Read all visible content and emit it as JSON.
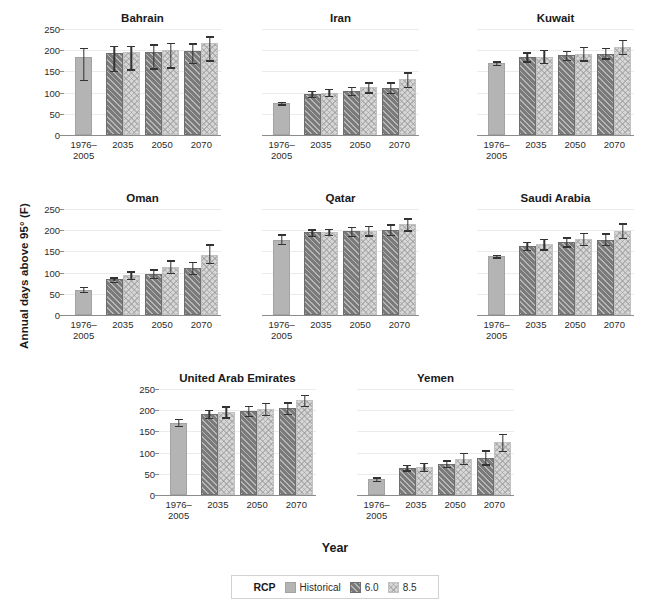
{
  "chart_data": {
    "type": "bar",
    "title": "",
    "xlabel": "Year",
    "ylabel": "Annual days above 95° (F)",
    "categories": [
      "1976–\n2005",
      "2035",
      "2050",
      "2070"
    ],
    "category_labels": [
      [
        "1976–",
        "2005"
      ],
      [
        "2035",
        ""
      ],
      [
        "2050",
        ""
      ],
      [
        "2070",
        ""
      ]
    ],
    "ylim": [
      0,
      250
    ],
    "yticks": [
      0,
      50,
      100,
      150,
      200,
      250
    ],
    "grid": true,
    "legend": {
      "title": "RCP",
      "position": "bottom-center",
      "entries": [
        {
          "label": "Historical",
          "key": "historical",
          "color": "#b4b4b4",
          "pattern": "solid"
        },
        {
          "label": "6.0",
          "key": "rcp60",
          "color": "#7a7a7a",
          "pattern": "diagonal-hatch"
        },
        {
          "label": "8.5",
          "key": "rcp85",
          "color": "#d6d6d6",
          "pattern": "crosshatch"
        }
      ]
    },
    "series": [
      {
        "name": "Historical",
        "key": "historical"
      },
      {
        "name": "6.0",
        "key": "rcp60"
      },
      {
        "name": "8.5",
        "key": "rcp85"
      }
    ],
    "panels": [
      {
        "title": "Bahrain",
        "show_yaxis": true,
        "row": 0,
        "col": 0,
        "data": [
          {
            "year": "1976–2005",
            "historical": {
              "value": 184,
              "low": 130,
              "high": 205
            },
            "rcp60": null,
            "rcp85": null
          },
          {
            "year": "2035",
            "historical": null,
            "rcp60": {
              "value": 194,
              "low": 151,
              "high": 210
            },
            "rcp85": {
              "value": 196,
              "low": 155,
              "high": 211
            }
          },
          {
            "year": "2050",
            "historical": null,
            "rcp60": {
              "value": 196,
              "low": 157,
              "high": 214
            },
            "rcp85": {
              "value": 200,
              "low": 160,
              "high": 217
            }
          },
          {
            "year": "2070",
            "historical": null,
            "rcp60": {
              "value": 199,
              "low": 170,
              "high": 216
            },
            "rcp85": {
              "value": 216,
              "low": 176,
              "high": 233
            }
          }
        ]
      },
      {
        "title": "Iran",
        "show_yaxis": false,
        "row": 0,
        "col": 1,
        "data": [
          {
            "year": "1976–2005",
            "historical": {
              "value": 75,
              "low": 72,
              "high": 78
            },
            "rcp60": null,
            "rcp85": null
          },
          {
            "year": "2035",
            "historical": null,
            "rcp60": {
              "value": 97,
              "low": 90,
              "high": 104
            },
            "rcp85": {
              "value": 100,
              "low": 92,
              "high": 109
            }
          },
          {
            "year": "2050",
            "historical": null,
            "rcp60": {
              "value": 104,
              "low": 95,
              "high": 114
            },
            "rcp85": {
              "value": 113,
              "low": 101,
              "high": 124
            }
          },
          {
            "year": "2070",
            "historical": null,
            "rcp60": {
              "value": 111,
              "low": 100,
              "high": 124
            },
            "rcp85": {
              "value": 131,
              "low": 113,
              "high": 148
            }
          }
        ]
      },
      {
        "title": "Kuwait",
        "show_yaxis": false,
        "row": 0,
        "col": 2,
        "data": [
          {
            "year": "1976–2005",
            "historical": {
              "value": 170,
              "low": 166,
              "high": 174
            },
            "rcp60": null,
            "rcp85": null
          },
          {
            "year": "2035",
            "historical": null,
            "rcp60": {
              "value": 184,
              "low": 174,
              "high": 195
            },
            "rcp85": {
              "value": 185,
              "low": 170,
              "high": 201
            }
          },
          {
            "year": "2050",
            "historical": null,
            "rcp60": {
              "value": 188,
              "low": 178,
              "high": 199
            },
            "rcp85": {
              "value": 191,
              "low": 176,
              "high": 208
            }
          },
          {
            "year": "2070",
            "historical": null,
            "rcp60": {
              "value": 192,
              "low": 181,
              "high": 205
            },
            "rcp85": {
              "value": 208,
              "low": 192,
              "high": 224
            }
          }
        ]
      },
      {
        "title": "Oman",
        "show_yaxis": true,
        "row": 1,
        "col": 0,
        "data": [
          {
            "year": "1976–2005",
            "historical": {
              "value": 60,
              "low": 54,
              "high": 66
            },
            "rcp60": null,
            "rcp85": null
          },
          {
            "year": "2035",
            "historical": null,
            "rcp60": {
              "value": 84,
              "low": 79,
              "high": 89
            },
            "rcp85": {
              "value": 94,
              "low": 86,
              "high": 103
            }
          },
          {
            "year": "2050",
            "historical": null,
            "rcp60": {
              "value": 97,
              "low": 88,
              "high": 108
            },
            "rcp85": {
              "value": 114,
              "low": 100,
              "high": 129
            }
          },
          {
            "year": "2070",
            "historical": null,
            "rcp60": {
              "value": 110,
              "low": 97,
              "high": 126
            },
            "rcp85": {
              "value": 142,
              "low": 123,
              "high": 167
            }
          }
        ]
      },
      {
        "title": "Qatar",
        "show_yaxis": false,
        "row": 1,
        "col": 1,
        "data": [
          {
            "year": "1976–2005",
            "historical": {
              "value": 178,
              "low": 168,
              "high": 190
            },
            "rcp60": null,
            "rcp85": null
          },
          {
            "year": "2035",
            "historical": null,
            "rcp60": {
              "value": 195,
              "low": 187,
              "high": 202
            },
            "rcp85": {
              "value": 196,
              "low": 189,
              "high": 203
            }
          },
          {
            "year": "2050",
            "historical": null,
            "rcp60": {
              "value": 197,
              "low": 187,
              "high": 208
            },
            "rcp85": {
              "value": 199,
              "low": 188,
              "high": 211
            }
          },
          {
            "year": "2070",
            "historical": null,
            "rcp60": {
              "value": 201,
              "low": 189,
              "high": 214
            },
            "rcp85": {
              "value": 214,
              "low": 200,
              "high": 228
            }
          }
        ]
      },
      {
        "title": "Saudi Arabia",
        "show_yaxis": false,
        "row": 1,
        "col": 2,
        "data": [
          {
            "year": "1976–2005",
            "historical": {
              "value": 139,
              "low": 136,
              "high": 142
            },
            "rcp60": null,
            "rcp85": null
          },
          {
            "year": "2035",
            "historical": null,
            "rcp60": {
              "value": 163,
              "low": 154,
              "high": 173
            },
            "rcp85": {
              "value": 167,
              "low": 155,
              "high": 180
            }
          },
          {
            "year": "2050",
            "historical": null,
            "rcp60": {
              "value": 172,
              "low": 162,
              "high": 183
            },
            "rcp85": {
              "value": 180,
              "low": 165,
              "high": 194
            }
          },
          {
            "year": "2070",
            "historical": null,
            "rcp60": {
              "value": 178,
              "low": 165,
              "high": 193
            },
            "rcp85": {
              "value": 199,
              "low": 182,
              "high": 216
            }
          }
        ]
      },
      {
        "title": "United Arab Emirates",
        "show_yaxis": true,
        "row": 2,
        "col": 0,
        "data": [
          {
            "year": "1976–2005",
            "historical": {
              "value": 171,
              "low": 163,
              "high": 180
            },
            "rcp60": null,
            "rcp85": null
          },
          {
            "year": "2035",
            "historical": null,
            "rcp60": {
              "value": 191,
              "low": 182,
              "high": 201
            },
            "rcp85": {
              "value": 195,
              "low": 183,
              "high": 209
            }
          },
          {
            "year": "2050",
            "historical": null,
            "rcp60": {
              "value": 198,
              "low": 187,
              "high": 210
            },
            "rcp85": {
              "value": 204,
              "low": 189,
              "high": 218
            }
          },
          {
            "year": "2070",
            "historical": null,
            "rcp60": {
              "value": 205,
              "low": 191,
              "high": 219
            },
            "rcp85": {
              "value": 224,
              "low": 211,
              "high": 236
            }
          }
        ]
      },
      {
        "title": "Yemen",
        "show_yaxis": false,
        "row": 2,
        "col": 1,
        "data": [
          {
            "year": "1976–2005",
            "historical": {
              "value": 37,
              "low": 33,
              "high": 42
            },
            "rcp60": null,
            "rcp85": null
          },
          {
            "year": "2035",
            "historical": null,
            "rcp60": {
              "value": 64,
              "low": 58,
              "high": 71
            },
            "rcp85": {
              "value": 66,
              "low": 57,
              "high": 76
            }
          },
          {
            "year": "2050",
            "historical": null,
            "rcp60": {
              "value": 74,
              "low": 67,
              "high": 82
            },
            "rcp85": {
              "value": 86,
              "low": 74,
              "high": 99
            }
          },
          {
            "year": "2070",
            "historical": null,
            "rcp60": {
              "value": 87,
              "low": 72,
              "high": 105
            },
            "rcp85": {
              "value": 124,
              "low": 104,
              "high": 144
            }
          }
        ]
      }
    ]
  }
}
